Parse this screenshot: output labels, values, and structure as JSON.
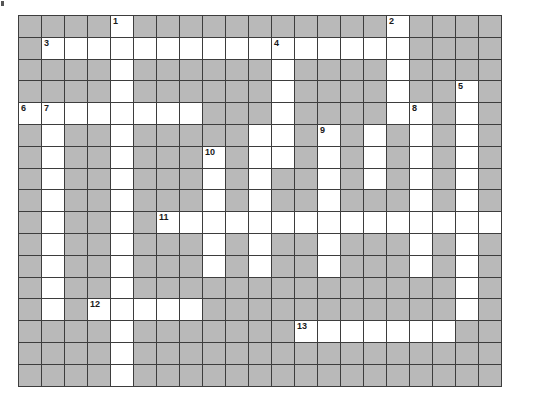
{
  "puzzle": {
    "title": "Crossword Grid",
    "columns": 21,
    "rows": 17,
    "colors": {
      "block": "#b9b9b9",
      "open": "#ffffff",
      "grid_line": "#3d3d3d",
      "number_text": "#1a1a1a",
      "page_background": "#ffffff"
    },
    "numbers": [
      {
        "n": "1",
        "row": 1,
        "col": 5
      },
      {
        "n": "2",
        "row": 1,
        "col": 17
      },
      {
        "n": "3",
        "row": 2,
        "col": 2
      },
      {
        "n": "4",
        "row": 2,
        "col": 12
      },
      {
        "n": "5",
        "row": 4,
        "col": 20
      },
      {
        "n": "6",
        "row": 5,
        "col": 1
      },
      {
        "n": "7",
        "row": 5,
        "col": 2
      },
      {
        "n": "8",
        "row": 5,
        "col": 18
      },
      {
        "n": "9",
        "row": 6,
        "col": 14
      },
      {
        "n": "10",
        "row": 7,
        "col": 9
      },
      {
        "n": "11",
        "row": 10,
        "col": 7
      },
      {
        "n": "12",
        "row": 14,
        "col": 4
      },
      {
        "n": "13",
        "row": 15,
        "col": 13
      }
    ],
    "open_cells": [
      [
        1,
        5
      ],
      [
        1,
        17
      ],
      [
        2,
        2
      ],
      [
        2,
        3
      ],
      [
        2,
        4
      ],
      [
        2,
        5
      ],
      [
        2,
        6
      ],
      [
        2,
        7
      ],
      [
        2,
        8
      ],
      [
        2,
        9
      ],
      [
        2,
        10
      ],
      [
        2,
        11
      ],
      [
        2,
        12
      ],
      [
        2,
        13
      ],
      [
        2,
        14
      ],
      [
        2,
        15
      ],
      [
        2,
        16
      ],
      [
        2,
        17
      ],
      [
        3,
        5
      ],
      [
        3,
        12
      ],
      [
        3,
        17
      ],
      [
        4,
        5
      ],
      [
        4,
        12
      ],
      [
        4,
        17
      ],
      [
        4,
        20
      ],
      [
        5,
        1
      ],
      [
        5,
        2
      ],
      [
        5,
        3
      ],
      [
        5,
        4
      ],
      [
        5,
        5
      ],
      [
        5,
        6
      ],
      [
        5,
        7
      ],
      [
        5,
        8
      ],
      [
        5,
        12
      ],
      [
        5,
        17
      ],
      [
        5,
        18
      ],
      [
        5,
        20
      ],
      [
        6,
        2
      ],
      [
        6,
        5
      ],
      [
        6,
        11
      ],
      [
        6,
        12
      ],
      [
        6,
        14
      ],
      [
        6,
        16
      ],
      [
        6,
        18
      ],
      [
        6,
        20
      ],
      [
        7,
        2
      ],
      [
        7,
        5
      ],
      [
        7,
        9
      ],
      [
        7,
        11
      ],
      [
        7,
        12
      ],
      [
        7,
        14
      ],
      [
        7,
        16
      ],
      [
        7,
        18
      ],
      [
        7,
        20
      ],
      [
        8,
        2
      ],
      [
        8,
        5
      ],
      [
        8,
        9
      ],
      [
        8,
        11
      ],
      [
        8,
        14
      ],
      [
        8,
        16
      ],
      [
        8,
        18
      ],
      [
        8,
        20
      ],
      [
        9,
        2
      ],
      [
        9,
        5
      ],
      [
        9,
        9
      ],
      [
        9,
        11
      ],
      [
        9,
        14
      ],
      [
        9,
        18
      ],
      [
        9,
        20
      ],
      [
        10,
        2
      ],
      [
        10,
        5
      ],
      [
        10,
        7
      ],
      [
        10,
        8
      ],
      [
        10,
        9
      ],
      [
        10,
        10
      ],
      [
        10,
        11
      ],
      [
        10,
        12
      ],
      [
        10,
        13
      ],
      [
        10,
        14
      ],
      [
        10,
        15
      ],
      [
        10,
        16
      ],
      [
        10,
        17
      ],
      [
        10,
        18
      ],
      [
        10,
        19
      ],
      [
        10,
        20
      ],
      [
        10,
        21
      ],
      [
        11,
        2
      ],
      [
        11,
        5
      ],
      [
        11,
        9
      ],
      [
        11,
        11
      ],
      [
        11,
        14
      ],
      [
        11,
        18
      ],
      [
        11,
        20
      ],
      [
        12,
        2
      ],
      [
        12,
        5
      ],
      [
        12,
        9
      ],
      [
        12,
        11
      ],
      [
        12,
        14
      ],
      [
        12,
        18
      ],
      [
        12,
        20
      ],
      [
        13,
        2
      ],
      [
        13,
        5
      ],
      [
        13,
        20
      ],
      [
        14,
        2
      ],
      [
        14,
        4
      ],
      [
        14,
        5
      ],
      [
        14,
        6
      ],
      [
        14,
        7
      ],
      [
        14,
        8
      ],
      [
        14,
        20
      ],
      [
        15,
        5
      ],
      [
        15,
        13
      ],
      [
        15,
        14
      ],
      [
        15,
        15
      ],
      [
        15,
        16
      ],
      [
        15,
        17
      ],
      [
        15,
        18
      ],
      [
        15,
        19
      ],
      [
        16,
        5
      ],
      [
        17,
        5
      ]
    ]
  }
}
